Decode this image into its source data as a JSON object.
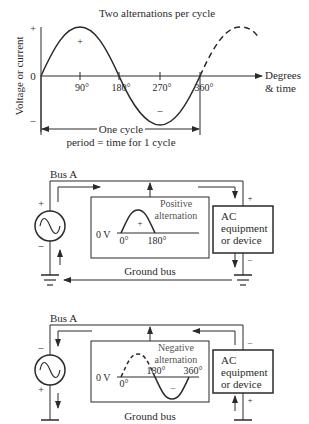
{
  "waveform": {
    "title": "Two alternations per cycle",
    "ylabel": "Voltage or current",
    "y_plus": "+",
    "y_zero": "0",
    "y_minus": "–",
    "xlabel_line1": "Degrees",
    "xlabel_line2": "& time",
    "ticks": [
      "90°",
      "180°",
      "270°",
      "360°"
    ],
    "pos_sign": "+",
    "neg_sign": "–",
    "cycle_label": "One cycle",
    "period_label": "period = time for 1 cycle"
  },
  "circuit_positive": {
    "bus_label": "Bus A",
    "ground_label": "Ground bus",
    "source_top_sign": "+",
    "source_bottom_sign": "–",
    "load_top_sign": "+",
    "load_bottom_sign": "–",
    "scope_title_1": "Positive",
    "scope_title_2": "alternation",
    "scope_zero": "0 V",
    "scope_tick_0": "0°",
    "scope_tick_1": "180°",
    "scope_sign": "+",
    "load_line1": "AC",
    "load_line2": "equipment",
    "load_line3": "or device"
  },
  "circuit_negative": {
    "bus_label": "Bus A",
    "ground_label": "Ground bus",
    "source_top_sign": "–",
    "source_bottom_sign": "+",
    "load_top_sign": "–",
    "load_bottom_sign": "+",
    "scope_title_1": "Negative",
    "scope_title_2": "alternation",
    "scope_zero": "0 V",
    "scope_tick_0": "0°",
    "scope_tick_1": "180°",
    "scope_tick_2": "360°",
    "scope_sign": "–",
    "load_line1": "AC",
    "load_line2": "equipment",
    "load_line3": "or device"
  }
}
